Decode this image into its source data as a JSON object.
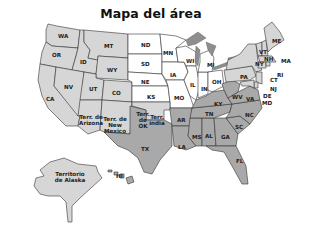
{
  "title": "Mapa del área",
  "colors": {
    "west_northeast": "#d6d6d6",
    "south": "#a9a9a9",
    "midwest": "#ffffff",
    "lakes": "#8e8e8e",
    "border": "#333333"
  },
  "regions": {
    "WA": "WA",
    "OR": "OR",
    "CA": "CA",
    "ID": "ID",
    "NV": "NV",
    "MT": "MT",
    "WY": "WY",
    "UT": "UT",
    "CO": "CO",
    "AZ": "Terr. de Arizona",
    "NM": "Terr. de New Mexico",
    "ND": "ND",
    "SD": "SD",
    "NE": "NE",
    "KS": "KS",
    "MN": "MN",
    "IA": "IA",
    "MO": "MO",
    "WI": "WI",
    "MI": "MI",
    "IL": "IL",
    "IN": "IN",
    "OH": "OH",
    "OK": "Terr. de OK",
    "INDIAN": "Terr. india",
    "TX": "TX",
    "AR": "AR",
    "LA": "LA",
    "MS": "MS",
    "AL": "AL",
    "GA": "GA",
    "FL": "FL",
    "TN": "TN",
    "KY": "KY",
    "SC": "SC",
    "NC": "NC",
    "VA": "VA",
    "WV": "WV",
    "PA": "PA",
    "NY": "NY",
    "ME": "ME",
    "VT": "VT",
    "NH": "NH",
    "MA": "MA",
    "RI": "RI",
    "CT": "CT",
    "NJ": "NJ",
    "DE": "DE",
    "MD": "MD",
    "AK": "Territorio de Alaska",
    "HI": "HI"
  }
}
